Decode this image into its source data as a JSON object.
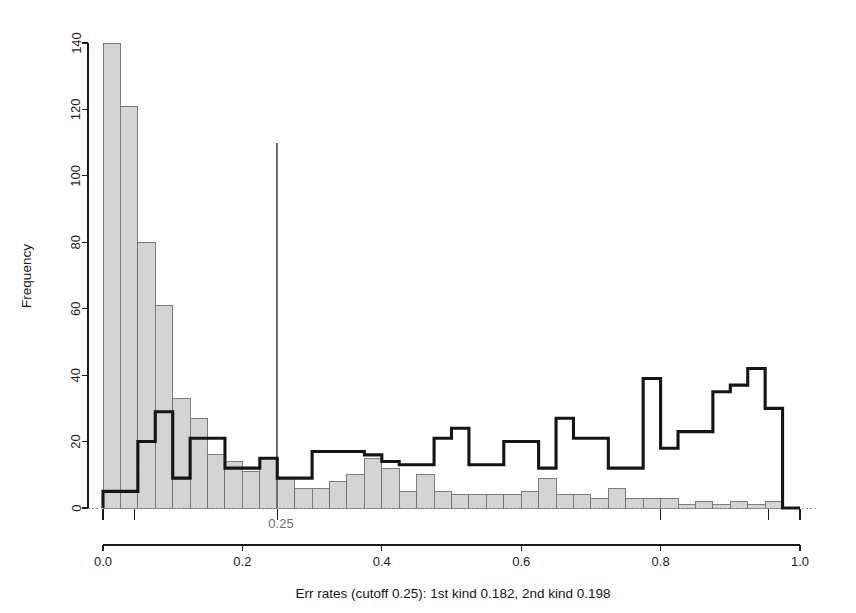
{
  "chart_data": {
    "type": "bar",
    "title": "",
    "subtitle": "",
    "xlabel": "Err rates (cutoff 0.25): 1st kind 0.182, 2nd kind 0.198",
    "ylabel": "Frequency",
    "xlim": [
      0.0,
      1.0
    ],
    "ylim": [
      0,
      145
    ],
    "grid": false,
    "legend": "none",
    "bin_width": 0.025,
    "x_ticks": [
      "0.0",
      "0.2",
      "0.4",
      "0.6",
      "0.8",
      "1.0"
    ],
    "x_tick_values": [
      0.0,
      0.2,
      0.4,
      0.6,
      0.8,
      1.0
    ],
    "y_ticks": [
      "0",
      "20",
      "40",
      "60",
      "80",
      "100",
      "120",
      "140"
    ],
    "y_tick_values": [
      0,
      20,
      40,
      60,
      80,
      100,
      120,
      140
    ],
    "bin_starts": [
      0.0,
      0.025,
      0.05,
      0.075,
      0.1,
      0.125,
      0.15,
      0.175,
      0.2,
      0.225,
      0.25,
      0.275,
      0.3,
      0.325,
      0.35,
      0.375,
      0.4,
      0.425,
      0.45,
      0.475,
      0.5,
      0.525,
      0.55,
      0.575,
      0.6,
      0.625,
      0.65,
      0.675,
      0.7,
      0.725,
      0.75,
      0.775,
      0.8,
      0.825,
      0.85,
      0.875,
      0.9,
      0.925,
      0.95,
      0.975
    ],
    "series": [
      {
        "name": "null-distribution-filled",
        "style": "filled-gray",
        "fill_color": "#d4d4d4",
        "border_color": "#707070",
        "values": [
          140,
          121,
          80,
          61,
          33,
          27,
          16,
          14,
          11,
          15,
          9,
          6,
          6,
          8,
          10,
          15,
          12,
          5,
          10,
          5,
          4,
          4,
          4,
          4,
          5,
          9,
          4,
          4,
          3,
          6,
          3,
          3,
          3,
          1,
          2,
          1,
          2,
          1,
          2,
          0
        ]
      },
      {
        "name": "alternative-distribution-outline",
        "style": "step-outline",
        "line_color": "#151515",
        "values": [
          5,
          5,
          20,
          29,
          9,
          21,
          21,
          12,
          12,
          15,
          9,
          9,
          17,
          17,
          17,
          16,
          14,
          13,
          13,
          21,
          24,
          13,
          13,
          20,
          20,
          12,
          27,
          21,
          21,
          12,
          12,
          39,
          18,
          23,
          23,
          35,
          37,
          42,
          30,
          0
        ]
      }
    ],
    "annotations": [
      {
        "name": "cutoff",
        "x": 0.25,
        "label": "0.25",
        "y_top": 110,
        "color": "#6f6f6f"
      }
    ]
  },
  "axes": {
    "y_label": "Frequency",
    "x_label": "Err rates (cutoff 0.25): 1st kind 0.182, 2nd kind 0.198"
  },
  "cutoff": {
    "label": "0.25"
  }
}
